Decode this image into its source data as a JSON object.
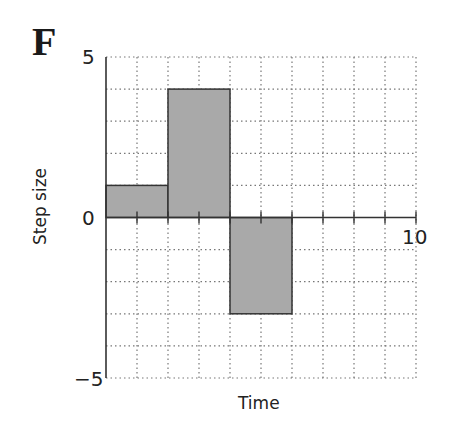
{
  "panel_label": "F",
  "chart_data": {
    "type": "bar",
    "subtype": "step",
    "title": "",
    "xlabel": "Time",
    "ylabel": "Step size",
    "xlim": [
      0,
      10
    ],
    "ylim": [
      -5,
      5
    ],
    "x_ticks_labeled": [
      5,
      10
    ],
    "y_ticks_labeled": [
      5,
      0,
      -5
    ],
    "grid": true,
    "grid_style": "dotted",
    "segments": [
      {
        "x_start": 0,
        "x_end": 2,
        "value": 1
      },
      {
        "x_start": 2,
        "x_end": 4,
        "value": 4
      },
      {
        "x_start": 4,
        "x_end": 6,
        "value": -3
      }
    ],
    "bar_color": "#a9a9a9",
    "edge_color": "#333333"
  },
  "labels": {
    "y_top": "5",
    "y_zero": "0",
    "y_bottom": "−5",
    "x_mid": "5",
    "x_end": "10",
    "xlabel": "Time",
    "ylabel": "Step size"
  }
}
